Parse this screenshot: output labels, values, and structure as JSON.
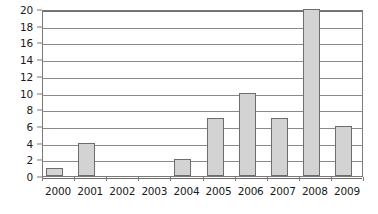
{
  "chart_data": {
    "type": "bar",
    "title": "",
    "subtitle": "",
    "xlabel": "",
    "ylabel": "",
    "categories": [
      "2000",
      "2001",
      "2002",
      "2003",
      "2004",
      "2005",
      "2006",
      "2007",
      "2008",
      "2009"
    ],
    "values": [
      1,
      4,
      0,
      0,
      2,
      7,
      10,
      7,
      20,
      6
    ],
    "ylim": [
      0,
      20
    ],
    "ytick_interval": 2,
    "yticks": [
      0,
      2,
      4,
      6,
      8,
      10,
      12,
      14,
      16,
      18,
      20
    ],
    "ytick_labels": [
      "0",
      "2",
      "4",
      "6",
      "8",
      "10",
      "12",
      "14",
      "16",
      "18",
      "20"
    ],
    "grid": true,
    "grid_axis": "y",
    "legend": false,
    "legend_position": "none",
    "series": [
      {
        "name": "",
        "values": [
          1,
          4,
          0,
          0,
          2,
          7,
          10,
          7,
          20,
          6
        ]
      }
    ],
    "annotations": []
  },
  "style": {
    "bar_fill": "#d3d3d3",
    "bar_border": "#6d6d6d",
    "grid_color": "#8a8a8a",
    "axis_color": "#7a7a7a",
    "text_color": "#1a1a1a",
    "background": "#ffffff"
  }
}
